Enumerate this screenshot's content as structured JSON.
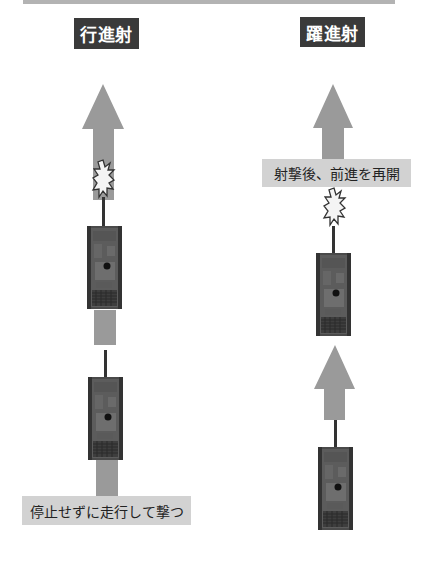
{
  "figure": {
    "colors": {
      "arrow": "#9a9a9a",
      "label_bg": "#3a3a3a",
      "label_text": "#ffffff",
      "caption_bg": "#d2d2d2",
      "caption_text": "#222222",
      "top_bar": "#b3b3b3",
      "flash_fill": "#f4f4f4",
      "tank_body": "#4a4a4a"
    },
    "left_panel": {
      "title": "行進射",
      "caption": "停止せずに走行して撃つ",
      "elements": [
        "arrow-up",
        "muzzle-flash",
        "tank",
        "movement-bar",
        "tank",
        "movement-bar"
      ]
    },
    "right_panel": {
      "title": "躍進射",
      "caption": "射撃後、前進を再開",
      "elements": [
        "arrow-up",
        "muzzle-flash",
        "tank",
        "arrow-up",
        "tank"
      ]
    }
  }
}
